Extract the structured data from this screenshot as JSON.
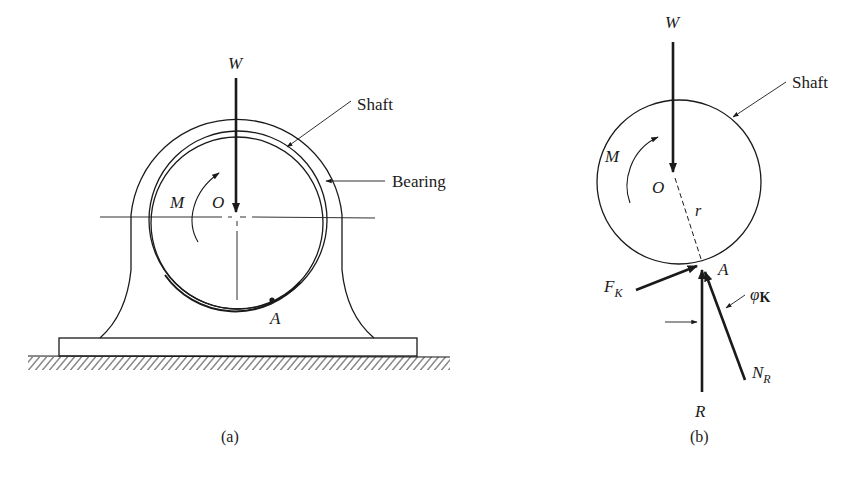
{
  "figure_a": {
    "caption": "(a)",
    "labels": {
      "weight": "W",
      "moment": "M",
      "center": "O",
      "contact_point": "A",
      "shaft": "Shaft",
      "bearing": "Bearing"
    }
  },
  "figure_b": {
    "caption": "(b)",
    "labels": {
      "weight": "W",
      "moment": "M",
      "center": "O",
      "radius": "r",
      "contact_point": "A",
      "shaft": "Shaft",
      "friction_force": "F",
      "friction_force_sub": "K",
      "normal_force": "N",
      "normal_force_sub": "R",
      "resultant": "R",
      "friction_angle": "φ",
      "friction_angle_sub": "K"
    }
  },
  "colors": {
    "ink": "#1a1a1a",
    "background": "#ffffff"
  }
}
